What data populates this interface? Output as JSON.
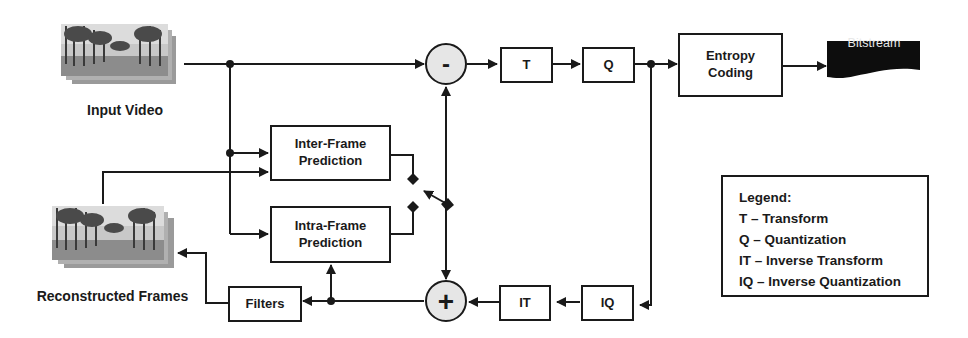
{
  "diagram": {
    "type": "video-encoder-block-diagram",
    "inputs": {
      "input_video_label": "Input Video",
      "reconstructed_frames_label": "Reconstructed Frames"
    },
    "blocks": {
      "transform": "T",
      "quantization": "Q",
      "entropy_coding": "Entropy\nCoding",
      "bitstream": "Bitstream",
      "inter_prediction": "Inter-Frame\nPrediction",
      "intra_prediction": "Intra-Frame\nPrediction",
      "inverse_transform": "IT",
      "inverse_quantization": "IQ",
      "filters": "Filters"
    },
    "operators": {
      "subtract": "-",
      "add": "+"
    },
    "legend": {
      "title": "Legend:",
      "items": [
        "T – Transform",
        "Q – Quantization",
        "IT – Inverse Transform",
        "IQ – Inverse Quantization"
      ]
    },
    "colors": {
      "line": "#1a1a1a",
      "operator_fill": "#e6e6e6",
      "bitstream_fill": "#0d0d0d",
      "bitstream_text": "#e8e8e8"
    }
  }
}
